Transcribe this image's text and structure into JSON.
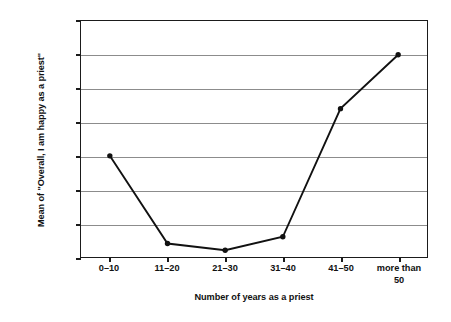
{
  "chart_data": {
    "type": "line",
    "title": "",
    "subtitle": "",
    "xlabel": "Number of years as a priest",
    "ylabel": "Mean of \"Overall, I am happy as a priest\"",
    "categories": [
      "0–10",
      "11–20",
      "21–30",
      "31–40",
      "41–50",
      "more than\n50"
    ],
    "values": [
      4.35,
      4.22,
      4.21,
      4.23,
      4.42,
      4.5
    ],
    "series": [
      {
        "name": "Mean happiness",
        "values": [
          4.35,
          4.22,
          4.21,
          4.23,
          4.42,
          4.5
        ]
      }
    ],
    "ylim": [
      4.2,
      4.55
    ],
    "ytick_labels": [
      "4.55",
      "4.5",
      "4.45",
      "4.4",
      "4.35",
      "4.3",
      "4.25",
      "4.2"
    ],
    "ytick_values": [
      4.55,
      4.5,
      4.45,
      4.4,
      4.35,
      4.3,
      4.25,
      4.2
    ],
    "grid": true,
    "legend": false,
    "legend_position": "none",
    "marker": "filled-circle",
    "line_color": "#111111",
    "marker_color": "#111111",
    "grid_color": "#8c8c8c",
    "axis_color": "#1b1b1b",
    "background_color": "#ffffff"
  }
}
